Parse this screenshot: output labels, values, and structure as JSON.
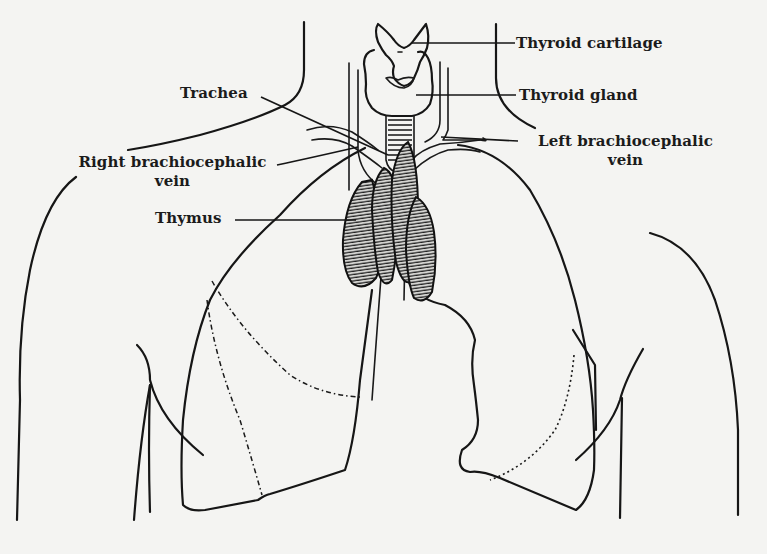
{
  "figure": {
    "background_color": "#f4f4f2",
    "ink_color": "#161616",
    "labels": [
      {
        "id": "thyroid-cartilage",
        "text": "Thyroid cartilage"
      },
      {
        "id": "thyroid-gland",
        "text": "Thyroid gland"
      },
      {
        "id": "trachea",
        "text": "Trachea"
      },
      {
        "id": "left-brachiocephalic-vein",
        "line1": "Left brachiocephalic",
        "line2": "vein"
      },
      {
        "id": "right-brachiocephalic-vein",
        "line1": "Right brachiocephalic",
        "line2": "vein"
      },
      {
        "id": "thymus",
        "text": "Thymus"
      }
    ]
  }
}
